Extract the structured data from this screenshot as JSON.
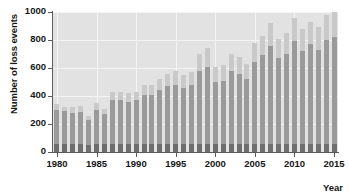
{
  "chart_data": {
    "type": "bar",
    "title": "",
    "xlabel": "Year",
    "ylabel": "Number of loss events",
    "ylim": [
      0,
      1000
    ],
    "xlim": [
      1979.5,
      2015.5
    ],
    "yticks": [
      0,
      200,
      400,
      600,
      800,
      1000
    ],
    "ytick_labels": [
      "0",
      "200",
      "400",
      "600",
      "800",
      "1000"
    ],
    "xticks": [
      1980,
      1985,
      1990,
      1995,
      2000,
      2005,
      2010,
      2015
    ],
    "xtick_labels": [
      "1980",
      "1985",
      "1990",
      "1995",
      "2000",
      "2005",
      "2010",
      "2015"
    ],
    "grid": true,
    "legend": "none",
    "stacked": true,
    "categories": [
      1980,
      1981,
      1982,
      1983,
      1984,
      1985,
      1986,
      1987,
      1988,
      1989,
      1990,
      1991,
      1992,
      1993,
      1994,
      1995,
      1996,
      1997,
      1998,
      1999,
      2000,
      2001,
      2002,
      2003,
      2004,
      2005,
      2006,
      2007,
      2008,
      2009,
      2010,
      2011,
      2012,
      2013,
      2014,
      2015
    ],
    "values": [
      340,
      320,
      320,
      330,
      260,
      350,
      310,
      430,
      430,
      420,
      430,
      480,
      480,
      520,
      560,
      580,
      550,
      570,
      700,
      740,
      610,
      620,
      700,
      680,
      630,
      780,
      830,
      920,
      810,
      850,
      960,
      880,
      930,
      890,
      980,
      1000
    ],
    "series": [
      {
        "name": "meteorological / storm (lower, dark)",
        "color": "#6e6e6e",
        "values": [
          300,
          290,
          280,
          285,
          230,
          300,
          275,
          370,
          370,
          360,
          370,
          410,
          410,
          440,
          470,
          480,
          460,
          480,
          580,
          610,
          500,
          510,
          580,
          560,
          520,
          640,
          690,
          760,
          670,
          700,
          790,
          720,
          770,
          730,
          800,
          820
        ]
      },
      {
        "name": "hydrological / climatological (upper, light)",
        "color": "#c9c9c9",
        "values": [
          40,
          30,
          40,
          45,
          30,
          50,
          35,
          60,
          60,
          60,
          60,
          70,
          70,
          80,
          90,
          100,
          90,
          90,
          120,
          130,
          110,
          110,
          120,
          120,
          110,
          140,
          140,
          160,
          140,
          150,
          170,
          160,
          160,
          160,
          180,
          180
        ]
      },
      {
        "name": "geophysical (base, darkest)",
        "color": "#6e6e6e",
        "values": [
          55,
          55,
          55,
          55,
          50,
          55,
          55,
          60,
          60,
          60,
          60,
          60,
          60,
          60,
          60,
          60,
          60,
          60,
          60,
          60,
          60,
          60,
          60,
          60,
          60,
          60,
          60,
          60,
          60,
          60,
          60,
          60,
          60,
          60,
          60,
          60
        ]
      }
    ]
  },
  "colors": {
    "plot_background": "#e2e2e2",
    "grid": "#f4f4f4",
    "axis": "#5b5b5b",
    "bar_light": "#c9c9c9",
    "bar_mid": "#9a9a9a",
    "bar_dark": "#6e6e6e",
    "text": "#161616"
  }
}
